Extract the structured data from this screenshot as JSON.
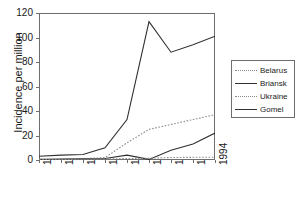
{
  "chart_data": {
    "type": "line",
    "title": "",
    "xlabel": "",
    "ylabel": "Incidence per million",
    "categories": [
      "1986",
      "1987",
      "1988",
      "1989",
      "1990",
      "1991",
      "1992",
      "1993",
      "1994"
    ],
    "x": [
      1986,
      1987,
      1988,
      1989,
      1990,
      1991,
      1992,
      1993,
      1994
    ],
    "xlim": [
      1986,
      1994
    ],
    "ylim": [
      0,
      120
    ],
    "yticks": [
      0,
      20,
      40,
      60,
      80,
      100,
      120
    ],
    "grid": false,
    "legend_position": "right",
    "series": [
      {
        "name": "Belarus",
        "style": "dotted",
        "color": "#8a8a8a",
        "values": [
          0.3,
          0.5,
          1.0,
          2.0,
          14.0,
          25.0,
          29.0,
          33.0,
          37.0
        ]
      },
      {
        "name": "Briansk",
        "style": "solid",
        "color": "#303030",
        "values": [
          0.5,
          0.8,
          1.0,
          1.2,
          4.0,
          0.5,
          8.0,
          13.0,
          22.0
        ]
      },
      {
        "name": "Ukraine",
        "style": "dotted",
        "color": "#8a8a8a",
        "values": [
          0.3,
          0.4,
          0.6,
          0.8,
          1.2,
          1.5,
          2.0,
          2.2,
          2.3
        ]
      },
      {
        "name": "Gomel",
        "style": "solid",
        "color": "#303030",
        "values": [
          3.0,
          4.0,
          4.5,
          10.0,
          33.0,
          113.0,
          88.0,
          94.0,
          101.0
        ]
      }
    ]
  },
  "axes": {
    "y_title": "Incidence per million",
    "y_tick_labels": [
      "0",
      "20",
      "40",
      "60",
      "80",
      "100",
      "120"
    ],
    "x_tick_labels": [
      "1986",
      "1987",
      "1988",
      "1989",
      "1990",
      "1991",
      "1992",
      "1993",
      "1994"
    ]
  },
  "legend": {
    "entries": [
      {
        "label": "Belarus",
        "style": "dotted"
      },
      {
        "label": "Briansk",
        "style": "solid"
      },
      {
        "label": "Ukraine",
        "style": "dotted"
      },
      {
        "label": "Gomel",
        "style": "solid"
      }
    ]
  }
}
